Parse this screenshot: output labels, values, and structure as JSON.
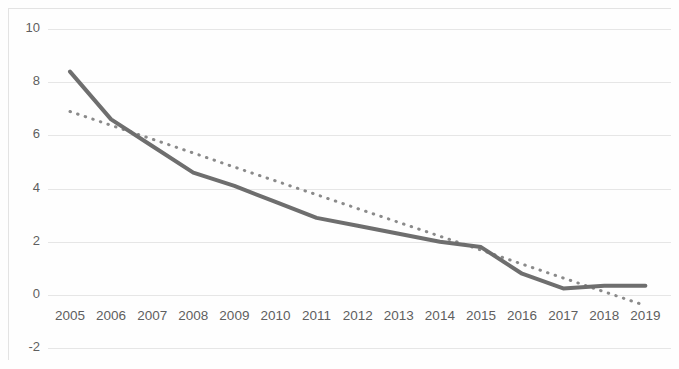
{
  "chart_data": {
    "type": "line",
    "title": "",
    "subtitle": "",
    "xlabel": "",
    "ylabel": "",
    "categories": [
      "2005",
      "2006",
      "2007",
      "2008",
      "2009",
      "2010",
      "2011",
      "2012",
      "2013",
      "2014",
      "2015",
      "2016",
      "2017",
      "2018",
      "2019"
    ],
    "x_tick_labels": [
      "2005",
      "2006",
      "2007",
      "2008",
      "2009",
      "2010",
      "2011",
      "2012",
      "2013",
      "2014",
      "2015",
      "2016",
      "2017",
      "2018",
      "2019"
    ],
    "y_tick_labels": [
      "10",
      "8",
      "6",
      "4",
      "2",
      "0",
      "-2"
    ],
    "y_ticks": [
      10,
      8,
      6,
      4,
      2,
      0,
      -2
    ],
    "ylim": [
      -2,
      10
    ],
    "grid": true,
    "grid_axis": "y",
    "legend": "none",
    "legend_position": "none",
    "series": [
      {
        "name": "data",
        "style": "solid",
        "color": "#6e6e6e",
        "width": 4,
        "values": [
          8.4,
          6.6,
          5.6,
          4.6,
          4.1,
          3.5,
          2.9,
          2.6,
          2.3,
          2.0,
          1.8,
          0.8,
          0.25,
          0.35,
          0.35
        ]
      },
      {
        "name": "trendline",
        "style": "dotted",
        "color": "#8a8a8a",
        "width": 3,
        "values": [
          6.9,
          6.38,
          5.86,
          5.34,
          4.81,
          4.29,
          3.77,
          3.25,
          2.73,
          2.21,
          1.69,
          1.16,
          0.64,
          0.12,
          -0.4
        ]
      }
    ]
  },
  "axes": {
    "plot_left": 48,
    "plot_right": 671,
    "y_pixel_for_10": 29,
    "y_pixel_for_0": 295,
    "px_per_unit": 26.6,
    "first_category_x": 70,
    "category_spacing": 41.1
  }
}
